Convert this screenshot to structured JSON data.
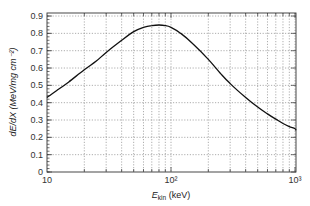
{
  "chart_data": {
    "type": "line",
    "title": "",
    "xlabel": "E_kin (keV)",
    "xlabel_main": "E",
    "xlabel_sub": "kin",
    "xlabel_unit": " (keV)",
    "ylabel": "dE/dX (MeV/mg cm⁻²)",
    "xscale": "log",
    "xlim": [
      10,
      1100
    ],
    "ylim": [
      0,
      0.92
    ],
    "grid": true,
    "legend": null,
    "x_tick_labels": [
      "10",
      "10²",
      "10³"
    ],
    "x_ticks": [
      10,
      100,
      1000
    ],
    "y_tick_labels": [
      "0",
      "0.1",
      "0.2",
      "0.3",
      "0.4",
      "0.5",
      "0.6",
      "0.7",
      "0.8",
      "0.9"
    ],
    "y_ticks": [
      0,
      0.1,
      0.2,
      0.3,
      0.4,
      0.5,
      0.6,
      0.7,
      0.8,
      0.9
    ],
    "series": [
      {
        "name": "dE/dX",
        "x": [
          10,
          12,
          15,
          20,
          25,
          30,
          40,
          50,
          60,
          70,
          80,
          90,
          100,
          120,
          150,
          200,
          250,
          300,
          400,
          500,
          600,
          700,
          800,
          900,
          1000,
          1100
        ],
        "y": [
          0.43,
          0.47,
          0.52,
          0.59,
          0.64,
          0.69,
          0.76,
          0.81,
          0.835,
          0.845,
          0.848,
          0.845,
          0.835,
          0.8,
          0.74,
          0.65,
          0.57,
          0.51,
          0.43,
          0.375,
          0.335,
          0.305,
          0.28,
          0.262,
          0.25,
          0.24
        ]
      }
    ]
  }
}
